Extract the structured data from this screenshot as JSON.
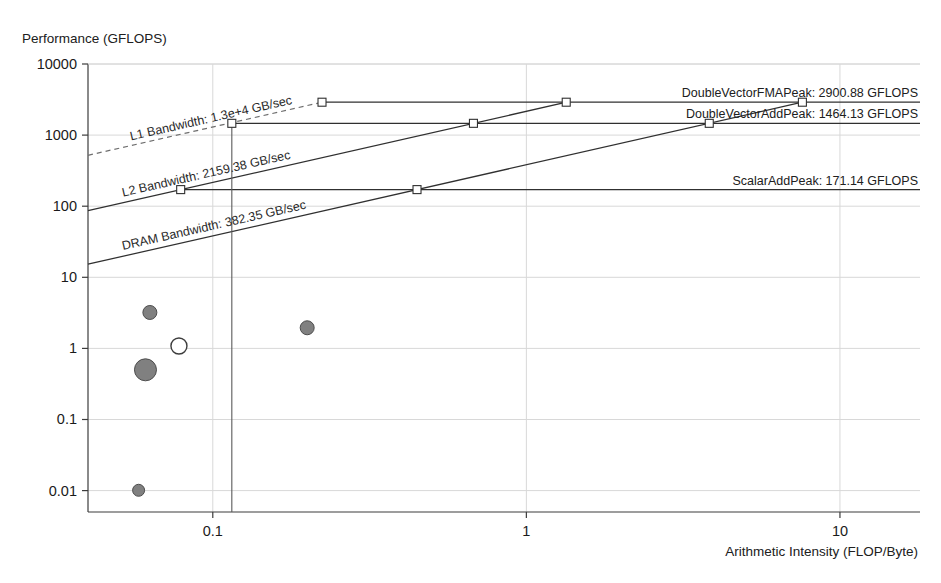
{
  "chart_data": {
    "type": "scatter",
    "title": "",
    "xlabel": "Arithmetic Intensity (FLOP/Byte)",
    "ylabel": "Performance (GFLOPS)",
    "xscale": "log",
    "yscale": "log",
    "xlim": [
      0.04,
      18
    ],
    "ylim": [
      0.005,
      10000
    ],
    "grid": true,
    "xticks": [
      "0.1",
      "1",
      "10"
    ],
    "xtick_values": [
      0.1,
      1,
      10
    ],
    "yticks": [
      "10000",
      "1000",
      "100",
      "10",
      "1",
      "0.1",
      "0.01"
    ],
    "ytick_values": [
      10000,
      1000,
      100,
      10,
      1,
      0.1,
      0.01
    ],
    "ceilings": [
      {
        "name": "DoubleVectorFMAPeak",
        "label": "DoubleVectorFMAPeak: 2900.88 GFLOPS",
        "value": 2900.88,
        "unit": "GFLOPS"
      },
      {
        "name": "DoubleVectorAddPeak",
        "label": "DoubleVectorAddPeak: 1464.13 GFLOPS",
        "value": 1464.13,
        "unit": "GFLOPS"
      },
      {
        "name": "ScalarAddPeak",
        "label": "ScalarAddPeak: 171.14 GFLOPS",
        "value": 171.14,
        "unit": "GFLOPS"
      }
    ],
    "bandwidths": [
      {
        "name": "L1 Bandwidth",
        "label": "L1 Bandwidth: 1.3e+4 GB/sec",
        "value": 13000,
        "unit": "GB/sec",
        "style": "dashed"
      },
      {
        "name": "L2 Bandwidth",
        "label": "L2 Bandwidth: 2159.38 GB/sec",
        "value": 2159.38,
        "unit": "GB/sec",
        "style": "solid"
      },
      {
        "name": "DRAM Bandwidth",
        "label": "DRAM Bandwidth: 382.35 GB/sec",
        "value": 382.35,
        "unit": "GB/sec",
        "style": "solid"
      }
    ],
    "series": [
      {
        "name": "kernels",
        "marker": "circle",
        "points": [
          {
            "x": 0.063,
            "y": 3.2,
            "size": 7,
            "fill": "filled"
          },
          {
            "x": 0.078,
            "y": 1.08,
            "size": 8,
            "fill": "hollow"
          },
          {
            "x": 0.061,
            "y": 0.5,
            "size": 11,
            "fill": "filled"
          },
          {
            "x": 0.2,
            "y": 1.95,
            "size": 7,
            "fill": "filled"
          },
          {
            "x": 0.058,
            "y": 0.0101,
            "size": 6,
            "fill": "filled"
          }
        ]
      }
    ],
    "ridge_markers": [
      {
        "x": 0.115,
        "y": 1464.13,
        "roof": "L1",
        "ceiling": "DoubleVectorAddPeak"
      },
      {
        "x": 0.223,
        "y": 2900.88,
        "roof": "L1",
        "ceiling": "DoubleVectorFMAPeak"
      },
      {
        "x": 0.079,
        "y": 171.14,
        "roof": "L2",
        "ceiling": "ScalarAddPeak"
      },
      {
        "x": 0.678,
        "y": 1464.13,
        "roof": "L2",
        "ceiling": "DoubleVectorAddPeak"
      },
      {
        "x": 1.34,
        "y": 2900.88,
        "roof": "L2",
        "ceiling": "DoubleVectorFMAPeak"
      },
      {
        "x": 0.448,
        "y": 171.14,
        "roof": "DRAM",
        "ceiling": "ScalarAddPeak"
      },
      {
        "x": 3.83,
        "y": 1464.13,
        "roof": "DRAM",
        "ceiling": "DoubleVectorAddPeak"
      },
      {
        "x": 7.59,
        "y": 2900.88,
        "roof": "DRAM",
        "ceiling": "DoubleVectorFMAPeak"
      }
    ],
    "annotations": [
      {
        "type": "vertical-line",
        "x": 0.115,
        "from": 0.005,
        "to": 1464.13
      }
    ],
    "colors": {
      "line": "#303030",
      "dashed_line": "#6e6e6e",
      "grid": "#d8d8d8",
      "marker_fill": "#808080",
      "marker_hollow": "#ffffff",
      "text": "#1a1a1a"
    }
  }
}
